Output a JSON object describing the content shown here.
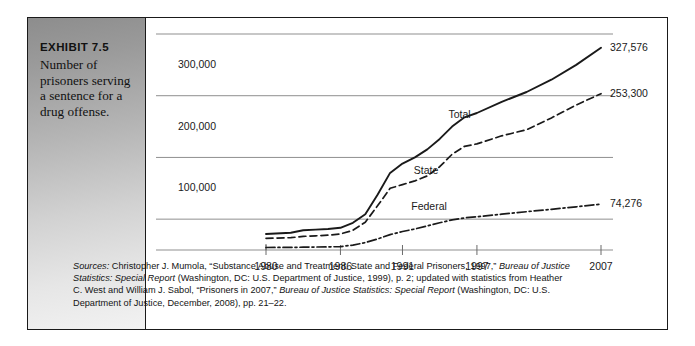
{
  "exhibit": {
    "label": "EXHIBIT 7.5",
    "caption": "Number of prisoners serving a sentence for a drug offense."
  },
  "source": {
    "lead": "Sources:",
    "text": " Christopher J. Mumola, “Substance Abuse and Treatment, State and Federal Prisoners, 1997,” ",
    "italic1": "Bureau of Justice Statistics: Special Report",
    "text2": " (Washington, DC: U.S. Department of Justice, 1999), p. 2; updated with statistics from Heather C. West and William J. Sabol, “Prisoners in 2007,” ",
    "italic2": "Bureau of Justice Statistics: Special Report",
    "text3": " (Washington, DC: U.S. Department of Justice, December, 2008), pp. 21–22."
  },
  "chart_data": {
    "type": "line",
    "title": "Number of prisoners serving a sentence for a drug offense",
    "xlabel": "",
    "ylabel": "",
    "xlim": [
      1980,
      2009
    ],
    "ylim": [
      0,
      350000
    ],
    "grid": true,
    "gridlines": [
      50000,
      150000,
      250000,
      350000
    ],
    "legend_position": "inline-annotations",
    "xticks": [
      1980,
      1986,
      1991,
      1997,
      2007
    ],
    "xtick_labels": [
      "1980",
      "1986",
      "1991",
      "1997",
      "2007"
    ],
    "yticks": [
      100000,
      200000,
      300000
    ],
    "ytick_labels": [
      "100,000",
      "200,000",
      "300,000"
    ],
    "series": [
      {
        "name": "Total",
        "style": "solid",
        "end_label": "327,576",
        "x": [
          1980,
          1982,
          1983,
          1984,
          1985,
          1986,
          1987,
          1988,
          1989,
          1990,
          1991,
          1992,
          1993,
          1994,
          1995,
          1996,
          1997,
          1999,
          2001,
          2003,
          2005,
          2007
        ],
        "values": [
          26000,
          28000,
          32000,
          33000,
          34000,
          36000,
          44000,
          58000,
          90000,
          125000,
          140000,
          150000,
          163000,
          180000,
          200000,
          215000,
          222000,
          240000,
          256000,
          276000,
          300000,
          327576
        ]
      },
      {
        "name": "State",
        "style": "dashed",
        "end_label": "253,300",
        "x": [
          1980,
          1982,
          1983,
          1984,
          1985,
          1986,
          1987,
          1988,
          1989,
          1990,
          1991,
          1992,
          1993,
          1994,
          1995,
          1996,
          1997,
          1999,
          2001,
          2003,
          2005,
          2007
        ],
        "values": [
          19000,
          20000,
          22000,
          23000,
          24000,
          26000,
          32000,
          45000,
          72000,
          100000,
          106000,
          112000,
          120000,
          135000,
          155000,
          168000,
          172000,
          185000,
          195000,
          214000,
          235000,
          253300
        ]
      },
      {
        "name": "Federal",
        "style": "dashdot",
        "end_label": "74,276",
        "x": [
          1980,
          1982,
          1983,
          1984,
          1985,
          1986,
          1987,
          1988,
          1989,
          1990,
          1991,
          1992,
          1993,
          1994,
          1995,
          1996,
          1997,
          1999,
          2001,
          2003,
          2005,
          2007
        ],
        "values": [
          4000,
          4200,
          4500,
          4800,
          5000,
          5500,
          8000,
          12000,
          18000,
          25000,
          30000,
          34000,
          39000,
          44000,
          49000,
          52000,
          54000,
          58000,
          62000,
          66000,
          70000,
          74276
        ]
      }
    ]
  }
}
